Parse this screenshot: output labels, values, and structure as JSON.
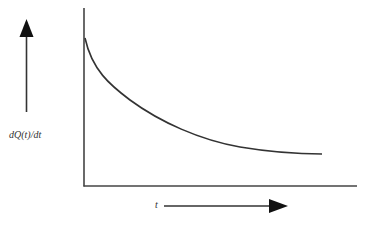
{
  "diagram": {
    "type": "line-sketch",
    "y_axis_label": "dQ(t)/dt",
    "x_axis_label": "t",
    "curve_description": "monotonically decreasing, convex curve starting high at t=0 and flattening toward an asymptote",
    "colors": {
      "line": "#333333",
      "background": "#ffffff"
    }
  }
}
